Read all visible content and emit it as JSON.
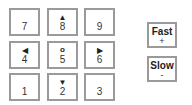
{
  "keypad": {
    "keys": [
      {
        "num": "7",
        "sym": ""
      },
      {
        "num": "8",
        "sym": "▲"
      },
      {
        "num": "9",
        "sym": ""
      },
      {
        "num": "4",
        "sym": "◀"
      },
      {
        "num": "5",
        "sym": "o"
      },
      {
        "num": "6",
        "sym": "▶"
      },
      {
        "num": "1",
        "sym": ""
      },
      {
        "num": "2",
        "sym": "▼"
      },
      {
        "num": "3",
        "sym": ""
      }
    ]
  },
  "speed": {
    "fast": {
      "label": "Fast",
      "sub": "+"
    },
    "slow": {
      "label": "Slow",
      "sub": "-"
    }
  }
}
